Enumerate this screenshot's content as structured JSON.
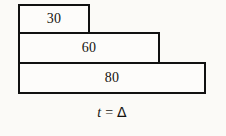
{
  "figure": {
    "type": "stepped-horizontal-bar-diagram",
    "caption": {
      "variable": "t",
      "operator": "=",
      "value": "Δ",
      "full_text": "t = Δ"
    },
    "colors": {
      "background": "#fbfaf7",
      "stroke": "#111111",
      "fill": "#fdfcfa",
      "text": "#15130f"
    }
  },
  "chart_data": {
    "type": "bar",
    "orientation": "horizontal",
    "title": "",
    "subtitle": "",
    "xlabel": "",
    "ylabel": "",
    "categories": [
      "30",
      "60",
      "80"
    ],
    "values": [
      30,
      60,
      80
    ],
    "labels": [
      "30",
      "60",
      "80"
    ],
    "series": [
      {
        "name": "",
        "values": [
          30,
          60,
          80
        ]
      }
    ],
    "xlim": [
      0,
      80
    ],
    "grid": false,
    "legend": false,
    "annotations": [
      "t = Δ"
    ],
    "bars": [
      {
        "label": "30",
        "value": 30
      },
      {
        "label": "60",
        "value": 60
      },
      {
        "label": "80",
        "value": 80
      }
    ]
  }
}
